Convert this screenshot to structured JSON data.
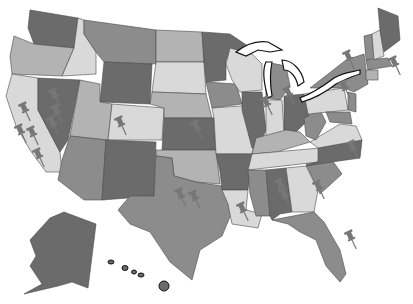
{
  "map": {
    "title": "United States map with pushpins",
    "colors": {
      "background": "#ffffff",
      "dark": "#6b6b6b",
      "mid": "#8c8c8c",
      "light": "#b3b3b3",
      "pale": "#d9d9d9",
      "pin": "#777777",
      "border": "#111111"
    },
    "states": [
      {
        "id": "WA",
        "shade": "dark",
        "points": "30,10 78,18 74,48 34,44 28,28"
      },
      {
        "id": "OR",
        "shade": "light",
        "points": "14,36 34,44 74,48 62,76 12,74 10,56"
      },
      {
        "id": "CA",
        "shade": "pale",
        "points": "12,74 38,78 38,110 60,152 62,172 46,172 30,150 16,126 6,96"
      },
      {
        "id": "ID",
        "shade": "pale",
        "points": "78,18 84,20 84,34 96,52 96,74 62,76 74,48"
      },
      {
        "id": "NV",
        "shade": "dark",
        "points": "38,78 80,80 68,140 60,152 38,110"
      },
      {
        "id": "MT",
        "shade": "mid",
        "points": "84,20 156,30 156,64 104,62 96,52 84,34"
      },
      {
        "id": "WY",
        "shade": "dark",
        "points": "104,62 152,64 150,104 100,102"
      },
      {
        "id": "UT",
        "shade": "light",
        "points": "80,80 100,84 100,102 112,104 108,140 70,136"
      },
      {
        "id": "CO",
        "shade": "pale",
        "points": "112,104 164,108 162,140 108,140"
      },
      {
        "id": "AZ",
        "shade": "mid",
        "points": "70,136 106,140 102,200 84,200 58,180 62,160"
      },
      {
        "id": "NM",
        "shade": "dark",
        "points": "106,140 156,142 154,196 102,200"
      },
      {
        "id": "ND",
        "shade": "light",
        "points": "156,30 202,32 204,62 156,62"
      },
      {
        "id": "SD",
        "shade": "pale",
        "points": "156,62 204,62 206,94 152,92"
      },
      {
        "id": "NE",
        "shade": "light",
        "points": "152,92 206,94 212,118 164,118 164,108 150,104"
      },
      {
        "id": "KS",
        "shade": "dark",
        "points": "164,118 214,118 216,150 162,150"
      },
      {
        "id": "OK",
        "shade": "light",
        "points": "156,150 216,150 220,184 196,182 174,176 172,158 156,156"
      },
      {
        "id": "TX",
        "shade": "mid",
        "points": "156,156 172,158 174,176 196,182 222,186 232,212 222,236 200,250 192,280 170,262 150,232 130,224 118,210 130,196 154,196"
      },
      {
        "id": "MN",
        "shade": "dark",
        "points": "202,32 230,34 248,46 226,60 226,80 206,82 204,62"
      },
      {
        "id": "IA",
        "shade": "mid",
        "points": "206,82 236,84 242,104 212,108"
      },
      {
        "id": "MO",
        "shade": "pale",
        "points": "212,108 242,106 256,140 252,154 216,154 214,118"
      },
      {
        "id": "AR",
        "shade": "dark",
        "points": "216,154 252,154 248,190 222,190 220,172"
      },
      {
        "id": "LA",
        "shade": "pale",
        "points": "222,190 248,190 246,210 262,214 258,228 232,224 228,204"
      },
      {
        "id": "WI",
        "shade": "pale",
        "points": "230,48 252,54 262,64 262,90 240,92 232,80 226,64"
      },
      {
        "id": "IL",
        "shade": "dark",
        "points": "242,92 262,92 266,130 258,150 252,148 242,110"
      },
      {
        "id": "MI",
        "shade": "mid",
        "points": "266,62 286,66 290,86 280,100 266,98"
      },
      {
        "id": "IN",
        "shade": "pale",
        "points": "266,100 282,100 284,132 266,138"
      },
      {
        "id": "OH",
        "shade": "dark",
        "points": "284,96 304,94 310,118 296,132 284,130"
      },
      {
        "id": "KY",
        "shade": "light",
        "points": "256,138 286,130 300,132 310,142 276,152 252,154"
      },
      {
        "id": "TN",
        "shade": "pale",
        "points": "252,154 320,148 318,162 248,170"
      },
      {
        "id": "MS",
        "shade": "mid",
        "points": "248,170 266,170 270,216 256,216 250,194"
      },
      {
        "id": "AL",
        "shade": "dark",
        "points": "266,170 286,168 292,212 280,214 272,220 270,216"
      },
      {
        "id": "GA",
        "shade": "pale",
        "points": "286,168 306,166 318,190 314,212 292,212"
      },
      {
        "id": "FL",
        "shade": "mid",
        "points": "272,220 314,212 324,222 340,250 346,274 340,282 326,266 316,240 300,232 288,224"
      },
      {
        "id": "SC",
        "shade": "mid",
        "points": "306,164 332,160 342,174 320,194"
      },
      {
        "id": "NC",
        "shade": "dark",
        "points": "318,148 362,140 360,158 332,162 306,166 318,162"
      },
      {
        "id": "VA",
        "shade": "pale",
        "points": "310,142 340,124 356,126 362,140 318,148"
      },
      {
        "id": "WV",
        "shade": "mid",
        "points": "304,118 320,110 326,122 316,140 306,136"
      },
      {
        "id": "PA",
        "shade": "pale",
        "points": "304,94 344,88 348,110 308,114"
      },
      {
        "id": "NY",
        "shade": "mid",
        "points": "310,88 346,60 364,54 368,84 354,92 344,88"
      },
      {
        "id": "VT",
        "shade": "mid",
        "points": "364,36 372,34 374,58 366,60"
      },
      {
        "id": "NH",
        "shade": "pale",
        "points": "372,34 380,30 384,56 374,60"
      },
      {
        "id": "ME",
        "shade": "dark",
        "points": "378,8 398,16 400,40 384,52 380,30"
      },
      {
        "id": "MA",
        "shade": "mid",
        "points": "366,60 388,58 392,66 368,70"
      },
      {
        "id": "CT",
        "shade": "light",
        "points": "366,70 378,70 378,80 366,80"
      },
      {
        "id": "NJ",
        "shade": "mid",
        "points": "348,92 356,94 356,112 348,110"
      },
      {
        "id": "MD",
        "shade": "mid",
        "points": "326,112 350,112 352,124 330,122"
      },
      {
        "id": "AK",
        "shade": "dark",
        "points": "50,218 64,212 96,224 88,288 72,282 58,286 24,294 42,284 30,266 36,256 30,240"
      }
    ],
    "hawaii": [
      {
        "cx": 111,
        "cy": 262,
        "rx": 3,
        "ry": 2
      },
      {
        "cx": 125,
        "cy": 268,
        "rx": 3,
        "ry": 2.5
      },
      {
        "cx": 134,
        "cy": 272,
        "rx": 2.5,
        "ry": 2
      },
      {
        "cx": 141,
        "cy": 275,
        "rx": 3,
        "ry": 2
      },
      {
        "cx": 164,
        "cy": 286,
        "rx": 5,
        "ry": 5
      }
    ],
    "pins": [
      {
        "label": "pin-nevada-1",
        "x": 56,
        "y": 98
      },
      {
        "label": "pin-nevada-2",
        "x": 58,
        "y": 114
      },
      {
        "label": "pin-nevada-3",
        "x": 54,
        "y": 126
      },
      {
        "label": "pin-california-1",
        "x": 26,
        "y": 112
      },
      {
        "label": "pin-california-2",
        "x": 22,
        "y": 134
      },
      {
        "label": "pin-california-3",
        "x": 34,
        "y": 136
      },
      {
        "label": "pin-california-4",
        "x": 40,
        "y": 158
      },
      {
        "label": "pin-colorado",
        "x": 122,
        "y": 126
      },
      {
        "label": "pin-kansas",
        "x": 198,
        "y": 130
      },
      {
        "label": "pin-texas-1",
        "x": 182,
        "y": 198
      },
      {
        "label": "pin-texas-2",
        "x": 196,
        "y": 200
      },
      {
        "label": "pin-louisiana",
        "x": 244,
        "y": 212
      },
      {
        "label": "pin-alabama-1",
        "x": 282,
        "y": 188
      },
      {
        "label": "pin-alabama-2",
        "x": 286,
        "y": 198
      },
      {
        "label": "pin-georgia",
        "x": 320,
        "y": 190
      },
      {
        "label": "pin-florida",
        "x": 352,
        "y": 240
      },
      {
        "label": "pin-indiana",
        "x": 268,
        "y": 106
      },
      {
        "label": "pin-michigan",
        "x": 290,
        "y": 96
      },
      {
        "label": "pin-new-york",
        "x": 350,
        "y": 60
      },
      {
        "label": "pin-new-jersey",
        "x": 346,
        "y": 90
      },
      {
        "label": "pin-massachusetts",
        "x": 396,
        "y": 66
      },
      {
        "label": "pin-virginia",
        "x": 354,
        "y": 150
      }
    ]
  }
}
